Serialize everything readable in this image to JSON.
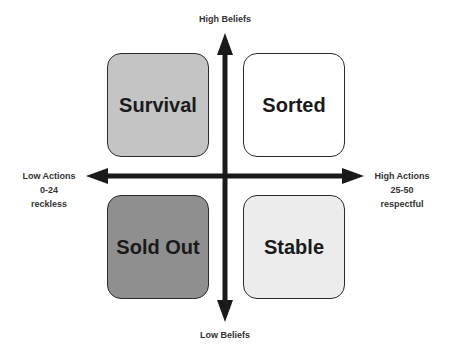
{
  "axes": {
    "top": "High Beliefs",
    "bottom": "Low Beliefs",
    "left": {
      "title": "Low Actions",
      "range": "0-24",
      "desc": "reckless"
    },
    "right": {
      "title": "High Actions",
      "range": "25-50",
      "desc": "respectful"
    }
  },
  "quadrants": [
    {
      "label": "Survival",
      "position": "top-left",
      "fill": "#c4c4c4"
    },
    {
      "label": "Sorted",
      "position": "top-right",
      "fill": "#ffffff"
    },
    {
      "label": "Sold Out",
      "position": "bottom-left",
      "fill": "#8f8f8f"
    },
    {
      "label": "Stable",
      "position": "bottom-right",
      "fill": "#ececec"
    }
  ],
  "colors": {
    "arrow": "#1a1a1a",
    "border": "#2a2a2a"
  }
}
